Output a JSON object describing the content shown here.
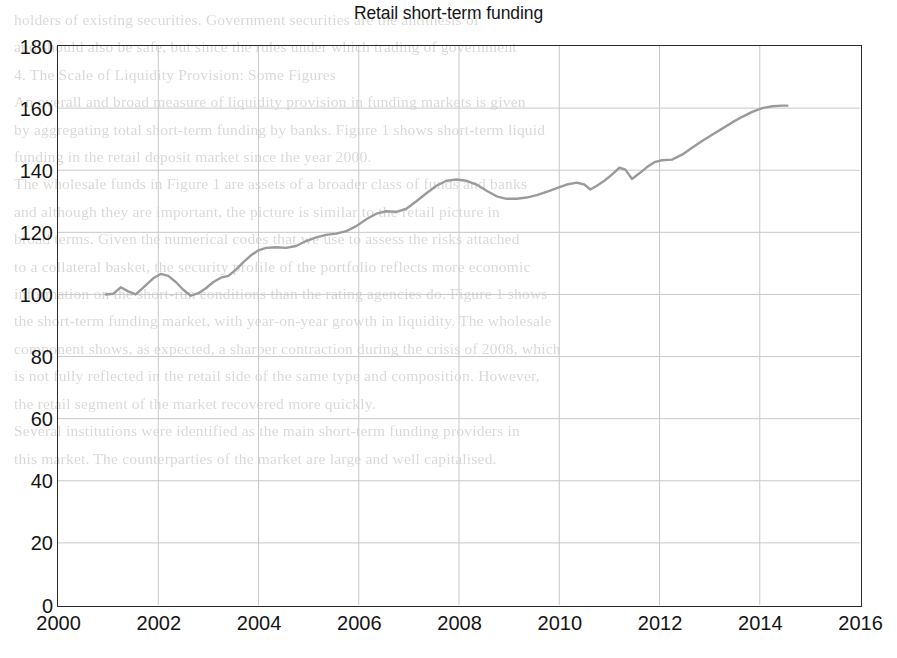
{
  "figure": {
    "title": "Retail short-term funding",
    "line_color": "#9a9a9a",
    "grid_color": "#c8c8c8",
    "axis_color": "#2b2b2b",
    "background": "#ffffff"
  },
  "axes": {
    "y_ticks": [
      "0",
      "20",
      "40",
      "60",
      "80",
      "100",
      "120",
      "140",
      "160",
      "180"
    ],
    "x_ticks": [
      "2000",
      "2002",
      "2004",
      "2006",
      "2008",
      "2010",
      "2012",
      "2014",
      "2016"
    ]
  },
  "page_bleed_lines": [
    "holders of existing securities. Government securities are the antithesis of",
    "and should also be safe, but since the rules under which trading of government",
    "",
    "4. The Scale of Liquidity Provision: Some Figures",
    "An overall and broad measure of liquidity provision in funding markets is given",
    "by aggregating total short-term funding by banks. Figure 1 shows short-term liquid",
    "funding in the retail deposit market since the year 2000.",
    "The wholesale funds in Figure 1 are assets of a broader class of funds and banks",
    "and although they are important, the picture is similar to the retail picture in",
    "broad terms. Given the numerical codes that we use to assess the risks attached",
    "to a collateral basket, the security profile of the portfolio reflects more economic",
    "information on the short-run conditions than the rating agencies do. Figure 1 shows",
    "the short-term funding market, with year-on-year growth in liquidity. The wholesale",
    "component shows, as expected, a sharper contraction during the crisis of 2008, which",
    "is not fully reflected in the retail side of the same type and composition. However,",
    "the retail segment of the market recovered more quickly.",
    "Several institutions were identified as the main short-term funding providers in",
    "this market. The counterparties of the market are large and well capitalised."
  ],
  "chart_data": {
    "type": "line",
    "title": "Retail short-term funding",
    "xlabel": "",
    "ylabel": "",
    "xlim": [
      2000,
      2016
    ],
    "ylim": [
      0,
      180
    ],
    "grid": true,
    "legend": false,
    "series": [
      {
        "name": "Retail short-term funding",
        "color": "#9a9a9a",
        "points": [
          [
            2000.95,
            100.0
          ],
          [
            2001.1,
            100.2
          ],
          [
            2001.25,
            102.3
          ],
          [
            2001.4,
            101.0
          ],
          [
            2001.55,
            100.0
          ],
          [
            2001.7,
            102.2
          ],
          [
            2001.9,
            105.2
          ],
          [
            2002.05,
            106.6
          ],
          [
            2002.2,
            106.0
          ],
          [
            2002.35,
            104.0
          ],
          [
            2002.5,
            101.5
          ],
          [
            2002.65,
            99.6
          ],
          [
            2002.8,
            100.4
          ],
          [
            2002.95,
            102.0
          ],
          [
            2003.1,
            104.0
          ],
          [
            2003.25,
            105.4
          ],
          [
            2003.4,
            106.0
          ],
          [
            2003.55,
            108.0
          ],
          [
            2003.7,
            110.4
          ],
          [
            2003.85,
            112.6
          ],
          [
            2004.0,
            114.2
          ],
          [
            2004.15,
            115.0
          ],
          [
            2004.35,
            115.2
          ],
          [
            2004.55,
            115.0
          ],
          [
            2004.75,
            115.6
          ],
          [
            2004.95,
            117.2
          ],
          [
            2005.15,
            118.4
          ],
          [
            2005.35,
            119.2
          ],
          [
            2005.55,
            119.6
          ],
          [
            2005.75,
            120.4
          ],
          [
            2005.95,
            122.0
          ],
          [
            2006.15,
            124.2
          ],
          [
            2006.35,
            126.0
          ],
          [
            2006.55,
            126.8
          ],
          [
            2006.75,
            126.6
          ],
          [
            2006.95,
            127.6
          ],
          [
            2007.15,
            130.0
          ],
          [
            2007.35,
            132.6
          ],
          [
            2007.55,
            135.0
          ],
          [
            2007.75,
            136.6
          ],
          [
            2007.95,
            137.0
          ],
          [
            2008.15,
            136.6
          ],
          [
            2008.35,
            135.4
          ],
          [
            2008.55,
            133.4
          ],
          [
            2008.75,
            131.6
          ],
          [
            2008.95,
            130.8
          ],
          [
            2009.15,
            130.8
          ],
          [
            2009.35,
            131.2
          ],
          [
            2009.55,
            132.0
          ],
          [
            2009.75,
            133.0
          ],
          [
            2009.95,
            134.2
          ],
          [
            2010.15,
            135.4
          ],
          [
            2010.35,
            136.0
          ],
          [
            2010.5,
            135.4
          ],
          [
            2010.62,
            133.8
          ],
          [
            2010.75,
            135.0
          ],
          [
            2010.9,
            136.6
          ],
          [
            2011.05,
            138.6
          ],
          [
            2011.2,
            140.8
          ],
          [
            2011.32,
            140.2
          ],
          [
            2011.45,
            137.2
          ],
          [
            2011.6,
            139.0
          ],
          [
            2011.75,
            141.0
          ],
          [
            2011.9,
            142.6
          ],
          [
            2012.05,
            143.2
          ],
          [
            2012.25,
            143.4
          ],
          [
            2012.45,
            145.0
          ],
          [
            2012.65,
            147.2
          ],
          [
            2012.85,
            149.4
          ],
          [
            2013.05,
            151.4
          ],
          [
            2013.25,
            153.4
          ],
          [
            2013.45,
            155.4
          ],
          [
            2013.65,
            157.2
          ],
          [
            2013.85,
            158.8
          ],
          [
            2014.05,
            160.0
          ],
          [
            2014.25,
            160.6
          ],
          [
            2014.45,
            160.8
          ],
          [
            2014.55,
            160.8
          ]
        ]
      }
    ]
  }
}
